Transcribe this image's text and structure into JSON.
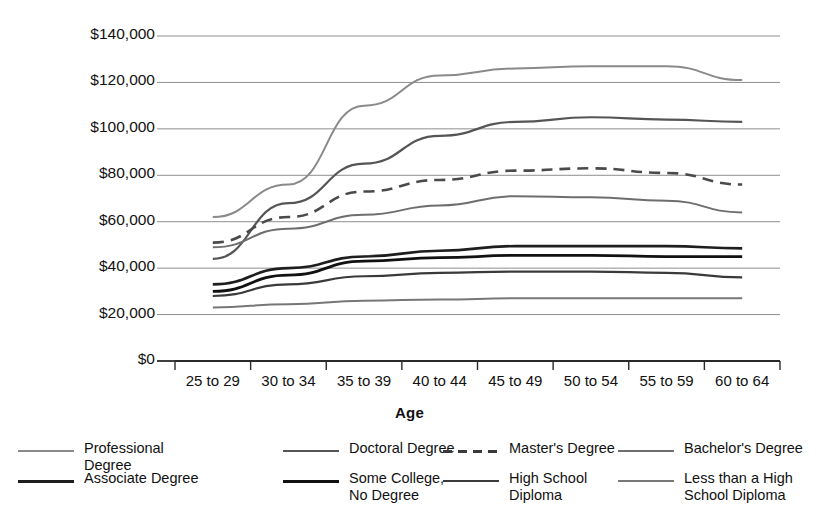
{
  "chart_data": {
    "type": "line",
    "title": "",
    "xlabel": "Age",
    "ylabel": "Median Earnings",
    "categories": [
      "25 to 29",
      "30 to 34",
      "35 to 39",
      "40 to 44",
      "45 to 49",
      "50 to 54",
      "55 to 59",
      "60 to 64"
    ],
    "ylim": [
      0,
      140000
    ],
    "ytick_values": [
      140000,
      120000,
      100000,
      80000,
      60000,
      40000,
      20000,
      0
    ],
    "ytick_labels": [
      "$140,000",
      "$120,000",
      "$100,000",
      "$80,000",
      "$60,000",
      "$40,000",
      "$20,000",
      "$0"
    ],
    "grid": true,
    "legend_position": "bottom",
    "series": [
      {
        "name": "Professional Degree",
        "style": "solid",
        "color": "#8a8a8a",
        "width": 2.0,
        "values": [
          62000,
          76000,
          110000,
          123000,
          126000,
          127000,
          127000,
          121000
        ]
      },
      {
        "name": "Doctoral Degree",
        "style": "solid",
        "color": "#555555",
        "width": 2.2,
        "values": [
          44000,
          68000,
          85000,
          97000,
          103000,
          105000,
          104000,
          103000
        ]
      },
      {
        "name": "Master's Degree",
        "style": "dashed",
        "color": "#4a4a4a",
        "width": 2.6,
        "values": [
          51000,
          62000,
          73000,
          78000,
          82000,
          83000,
          81000,
          76000
        ]
      },
      {
        "name": "Bachelor's Degree",
        "style": "solid",
        "color": "#6e6e6e",
        "width": 2.0,
        "values": [
          49000,
          57000,
          63000,
          67000,
          71000,
          70500,
          69000,
          64000
        ]
      },
      {
        "name": "Associate Degree",
        "style": "solid",
        "color": "#1e1e1e",
        "width": 2.6,
        "values": [
          33000,
          40000,
          45000,
          47500,
          49500,
          49500,
          49500,
          48500
        ]
      },
      {
        "name": "Some College, No Degree",
        "style": "solid",
        "color": "#111111",
        "width": 2.8,
        "values": [
          30000,
          37000,
          43000,
          44500,
          45500,
          45500,
          45000,
          45000
        ]
      },
      {
        "name": "High School Diploma",
        "style": "solid",
        "color": "#3a3a3a",
        "width": 2.2,
        "values": [
          28000,
          33000,
          36500,
          38000,
          38500,
          38500,
          38000,
          36000
        ]
      },
      {
        "name": "Less than a High School Diploma",
        "style": "solid",
        "color": "#777777",
        "width": 2.0,
        "values": [
          23000,
          24500,
          26000,
          26500,
          27000,
          27000,
          27000,
          27000
        ]
      }
    ]
  },
  "axis": {
    "ylabel": "Median Earnings",
    "xlabel": "Age",
    "yticks": [
      "$140,000",
      "$120,000",
      "$100,000",
      "$80,000",
      "$60,000",
      "$40,000",
      "$20,000",
      "$0"
    ],
    "xticks": [
      "25 to 29",
      "30 to 34",
      "35 to 39",
      "40 to 44",
      "45 to 49",
      "50 to 54",
      "55 to 59",
      "60 to 64"
    ]
  },
  "legend": {
    "columns": [
      [
        {
          "label": "Professional Degree",
          "style": "solid",
          "color": "#8a8a8a",
          "width": 2.0
        },
        {
          "label": "Associate Degree",
          "style": "solid",
          "color": "#1e1e1e",
          "width": 3.0
        }
      ],
      [
        {
          "label": "Doctoral Degree",
          "style": "solid",
          "color": "#555555",
          "width": 2.4
        },
        {
          "label": "Some College,\nNo Degree",
          "style": "solid",
          "color": "#111111",
          "width": 3.4
        }
      ],
      [
        {
          "label": "Master's Degree",
          "style": "dashed",
          "color": "#3a3a3a",
          "width": 2.8
        },
        {
          "label": "High School\nDiploma",
          "style": "solid",
          "color": "#3a3a3a",
          "width": 2.4
        }
      ],
      [
        {
          "label": "Bachelor's Degree",
          "style": "solid",
          "color": "#6e6e6e",
          "width": 2.0
        },
        {
          "label": "Less than a High\nSchool Diploma",
          "style": "solid",
          "color": "#777777",
          "width": 2.2
        }
      ]
    ]
  }
}
